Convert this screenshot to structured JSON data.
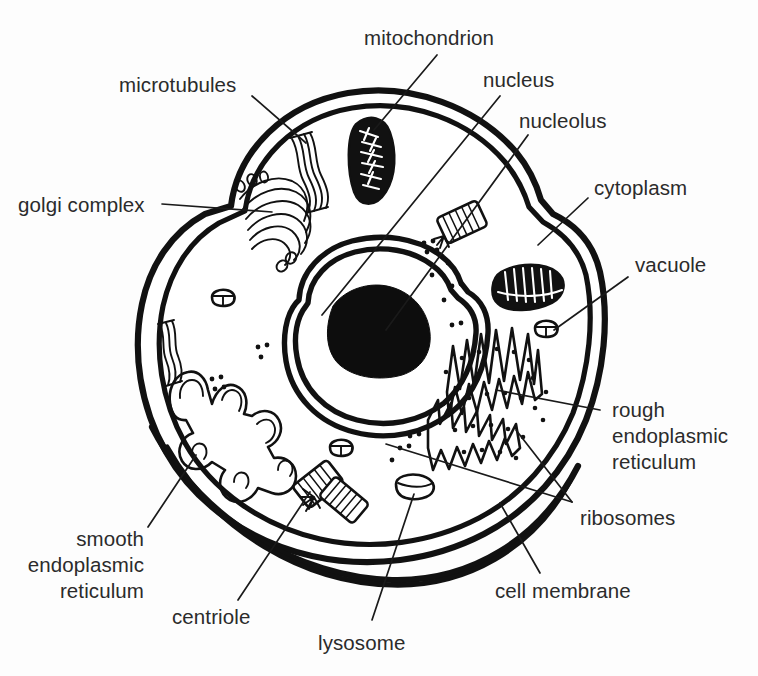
{
  "diagram": {
    "background_color": "#fdfdfd",
    "line_color": "#111111",
    "text_color": "#2b2b2b"
  },
  "labels": {
    "mitochondrion": "mitochondrion",
    "microtubules": "microtubules",
    "nucleus": "nucleus",
    "nucleolus": "nucleolus",
    "golgi_complex": "golgi complex",
    "cytoplasm": "cytoplasm",
    "vacuole": "vacuole",
    "rough_er_line1": "rough",
    "rough_er_line2": "endoplasmic",
    "rough_er_line3": "reticulum",
    "ribosomes": "ribosomes",
    "smooth_er_line1": "smooth",
    "smooth_er_line2": "endoplasmic",
    "smooth_er_line3": "reticulum",
    "centriole": "centriole",
    "lysosome": "lysosome",
    "cell_membrane": "cell membrane"
  },
  "structures": [
    {
      "name": "cell-membrane",
      "label": "cell membrane",
      "description": "double-line outer boundary of the cell with lobed outline"
    },
    {
      "name": "cytoplasm",
      "label": "cytoplasm",
      "description": "interior fluid space of the cell"
    },
    {
      "name": "nucleus",
      "label": "nucleus",
      "description": "large central organelle with double envelope"
    },
    {
      "name": "nucleolus",
      "label": "nucleolus",
      "description": "solid dark mass inside the nucleus"
    },
    {
      "name": "mitochondrion",
      "label": "mitochondrion",
      "description": "bean-shaped organelle with internal cristae",
      "count": 2
    },
    {
      "name": "golgi-complex",
      "label": "golgi complex",
      "description": "stack of flattened curved membranes upper left"
    },
    {
      "name": "microtubules",
      "label": "microtubules",
      "description": "striped ribbon-like filaments",
      "count": 2
    },
    {
      "name": "rough-endoplasmic-reticulum",
      "label": "rough endoplasmic reticulum",
      "description": "folded membranes studded with ribosomes"
    },
    {
      "name": "smooth-endoplasmic-reticulum",
      "label": "smooth endoplasmic reticulum",
      "description": "branching tubular network, no ribosomes"
    },
    {
      "name": "ribosomes",
      "label": "ribosomes",
      "description": "small dots free in cytoplasm and on rough ER"
    },
    {
      "name": "centriole",
      "label": "centriole",
      "description": "pair of striped cylinders at right angles"
    },
    {
      "name": "lysosome",
      "label": "lysosome",
      "description": "small oval vesicle with a line across it"
    },
    {
      "name": "vacuole",
      "label": "vacuole",
      "description": "small rounded storage sacs",
      "count": 3
    }
  ]
}
